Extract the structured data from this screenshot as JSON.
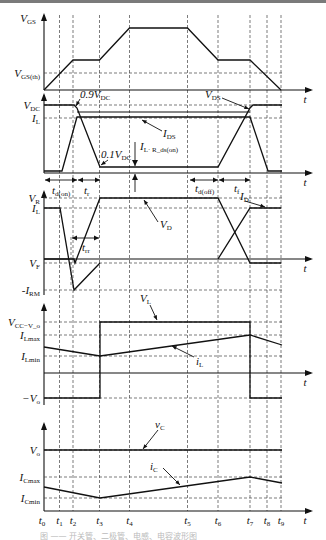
{
  "figure": {
    "caption": "图 —— 开关管、二极管、电感、电容波形图"
  },
  "time_marks": {
    "labels": [
      "t0",
      "t1",
      "t2",
      "t3",
      "t4",
      "t5",
      "t6",
      "t7",
      "t8",
      "t9"
    ],
    "x": [
      44,
      59.5,
      73,
      99.5,
      129.5,
      187.5,
      218,
      250,
      267,
      281
    ],
    "axis_label": "t"
  },
  "panels": [
    {
      "id": "vgs",
      "y_axis_label": "V_GS",
      "levels": [
        {
          "name": "V_GS(th)",
          "y": 73
        }
      ],
      "axis_y": 90,
      "top_y": 13,
      "traces": [
        {
          "name": "V_GS",
          "points": [
            [
              44,
              90
            ],
            [
              73,
              60
            ],
            [
              99.5,
              60
            ],
            [
              129.5,
              28
            ],
            [
              187.5,
              28
            ],
            [
              218,
              60
            ],
            [
              250,
              60
            ],
            [
              281,
              90
            ]
          ]
        }
      ]
    },
    {
      "id": "vds-ids",
      "levels": [
        {
          "name": "V_DC",
          "y": 105
        },
        {
          "name": "I_L",
          "y": 118
        }
      ],
      "axis_y": 173,
      "top_y": 93,
      "traces": [
        {
          "name": "V_DS",
          "points": [
            [
              44,
              105
            ],
            [
              74,
              105
            ],
            [
              77,
              108
            ],
            [
              100,
              167
            ],
            [
              218,
              167
            ],
            [
              250,
              108
            ],
            [
              253,
              105
            ],
            [
              282,
              105
            ]
          ]
        },
        {
          "name": "I_DS",
          "points": [
            [
              44,
              171
            ],
            [
              62,
              171
            ],
            [
              77,
              117
            ],
            [
              250,
              117
            ],
            [
              268,
              171
            ],
            [
              282,
              171
            ]
          ]
        }
      ],
      "annotations": [
        "0.9V_DC",
        "V_DS",
        "I_DS",
        "0.1V_DC",
        "I_L·R_ds(on)",
        "t_d(on)",
        "t_r",
        "t_d(off)",
        "t_f"
      ]
    },
    {
      "id": "diode",
      "levels": [
        {
          "name": "V_R",
          "y": 198
        },
        {
          "name": "I_L",
          "y": 208
        },
        {
          "name": "V_F",
          "y": 263
        },
        {
          "name": "-I_RM",
          "y": 290
        }
      ],
      "axis_y": 259,
      "top_y": 190,
      "traces": [
        {
          "name": "I_D",
          "points": [
            [
              44,
              208
            ],
            [
              60,
              208
            ],
            [
              74,
              290
            ],
            [
              100,
              263
            ]
          ]
        },
        {
          "name": "V_D",
          "points": [
            [
              44,
              259
            ],
            [
              74,
              259
            ],
            [
              75,
              263
            ],
            [
              100,
              198
            ],
            [
              218,
              198
            ],
            [
              250,
              263
            ],
            [
              281,
              263
            ]
          ]
        },
        {
          "name": "I_D_rise",
          "points": [
            [
              218,
              259
            ],
            [
              250,
              208
            ],
            [
              281,
              208
            ]
          ]
        }
      ],
      "annotations": [
        "V_D",
        "I_D",
        "t_rr"
      ]
    },
    {
      "id": "inductor",
      "levels": [
        {
          "name": "V_CC−V_o",
          "y": 322
        },
        {
          "name": "I_Lmax",
          "y": 335
        },
        {
          "name": "I_Lmin",
          "y": 356
        },
        {
          "name": "−V_o",
          "y": 398
        }
      ],
      "axis_y": 373,
      "top_y": 303,
      "traces": [
        {
          "name": "V_L",
          "points": [
            [
              44,
              398
            ],
            [
              100,
              398
            ],
            [
              100,
              322
            ],
            [
              250,
              322
            ],
            [
              250,
              398
            ],
            [
              282,
              398
            ]
          ]
        },
        {
          "name": "i_L",
          "points": [
            [
              44,
              347
            ],
            [
              100,
              356
            ],
            [
              250,
              335
            ],
            [
              282,
              345
            ]
          ]
        }
      ],
      "annotations": [
        "V_L",
        "i_L"
      ]
    },
    {
      "id": "capacitor",
      "levels": [
        {
          "name": "V_o",
          "y": 450
        },
        {
          "name": "I_Cmax",
          "y": 477
        },
        {
          "name": "I_Cmin",
          "y": 498
        }
      ],
      "axis_y": 511,
      "top_y": 422,
      "traces": [
        {
          "name": "v_C",
          "points": [
            [
              44,
              450
            ],
            [
              282,
              450
            ]
          ]
        },
        {
          "name": "i_C",
          "points": [
            [
              44,
              487
            ],
            [
              100,
              498
            ],
            [
              250,
              477
            ],
            [
              282,
              483
            ]
          ]
        }
      ],
      "annotations": [
        "v_C",
        "i_C"
      ]
    }
  ]
}
